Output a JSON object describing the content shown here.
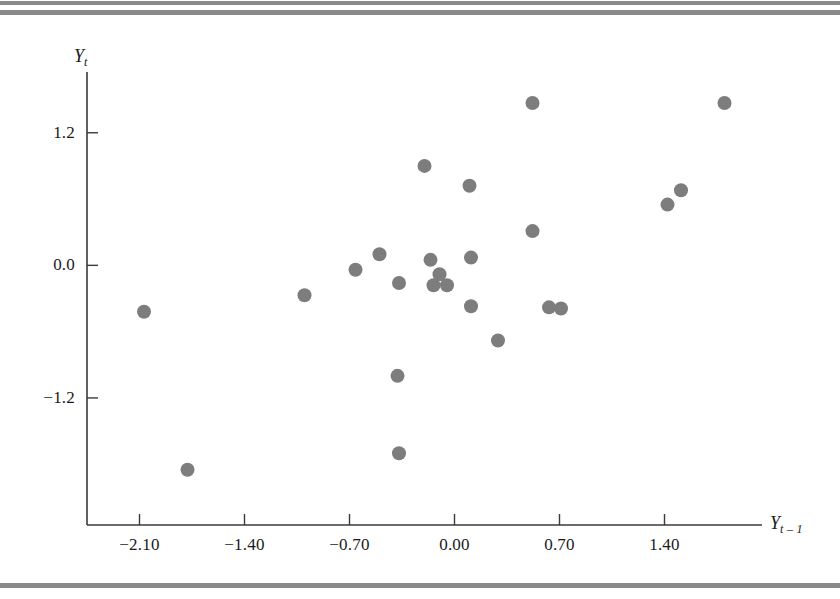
{
  "figure": {
    "background_color": "#ffffff",
    "rule_color": "#8a8a8a",
    "axis_color": "#3a3a3a",
    "marker_color": "#7d7d7d",
    "marker_radius_px": 7
  },
  "chart_data": {
    "type": "scatter",
    "title": "",
    "xlabel": "Y t-1",
    "ylabel": "Y t",
    "xlabel_base": "Y",
    "xlabel_sub": "t – 1",
    "ylabel_base": "Y",
    "ylabel_sub": "t",
    "xlim": [
      -2.45,
      2.05
    ],
    "ylim": [
      -2.35,
      1.75
    ],
    "xticks": [
      -2.1,
      -1.4,
      -0.7,
      0.0,
      0.7,
      1.4
    ],
    "xtick_labels": [
      "−2.10",
      "−1.40",
      "−0.70",
      "0.00",
      "0.70",
      "1.40"
    ],
    "yticks": [
      1.2,
      0.0,
      -1.2
    ],
    "ytick_labels": [
      "1.2",
      "0.0",
      "−1.2"
    ],
    "grid": false,
    "legend": null,
    "n_points": 24,
    "x": [
      -2.07,
      -1.78,
      -1.0,
      -0.66,
      -0.5,
      -0.37,
      -0.2,
      -0.16,
      -0.1,
      -0.1,
      -0.1,
      -0.06,
      -0.02,
      0.11,
      0.13,
      0.3,
      0.52,
      0.63,
      0.63,
      0.7,
      1.42,
      1.45,
      0.51,
      1.8
    ],
    "y": [
      -0.42,
      -1.85,
      -0.27,
      -0.04,
      0.1,
      -0.16,
      0.9,
      -1.0,
      -1.7,
      0.05,
      -0.18,
      -0.3,
      0.72,
      0.07,
      -0.38,
      -0.68,
      0.31,
      -0.42,
      -0.38,
      -0.39,
      0.55,
      0.68,
      1.47,
      1.47
    ],
    "points": [
      {
        "x": -2.07,
        "y": -0.42
      },
      {
        "x": -1.78,
        "y": -1.85
      },
      {
        "x": -1.0,
        "y": -0.27
      },
      {
        "x": -0.66,
        "y": -0.04
      },
      {
        "x": -0.5,
        "y": 0.1
      },
      {
        "x": -0.37,
        "y": -0.16
      },
      {
        "x": -0.2,
        "y": 0.9
      },
      {
        "x": -0.38,
        "y": -1.0
      },
      {
        "x": -0.37,
        "y": -1.7
      },
      {
        "x": -0.16,
        "y": 0.05
      },
      {
        "x": -0.1,
        "y": -0.08
      },
      {
        "x": -0.05,
        "y": -0.18
      },
      {
        "x": 0.1,
        "y": 0.72
      },
      {
        "x": 0.11,
        "y": 0.07
      },
      {
        "x": 0.11,
        "y": -0.37
      },
      {
        "x": 0.29,
        "y": -0.68
      },
      {
        "x": 0.52,
        "y": 0.31
      },
      {
        "x": 0.63,
        "y": -0.38
      },
      {
        "x": 0.71,
        "y": -0.39
      },
      {
        "x": 0.52,
        "y": 1.47
      },
      {
        "x": 1.42,
        "y": 0.55
      },
      {
        "x": 1.51,
        "y": 0.68
      },
      {
        "x": 1.8,
        "y": 1.47
      },
      {
        "x": -0.14,
        "y": -0.18
      }
    ]
  }
}
